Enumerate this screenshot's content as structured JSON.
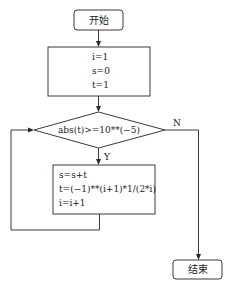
{
  "flowchart": {
    "start": {
      "label": "开始"
    },
    "init": {
      "lines": [
        "i=1",
        "s=0",
        "t=1"
      ]
    },
    "condition": {
      "label": "abs(t)>=10**(−5)"
    },
    "branch_yes": "Y",
    "branch_no": "N",
    "body": {
      "lines": [
        "s=s+t",
        "t=(−1)**(i+1)*1/(2*i)",
        "i=i+1"
      ]
    },
    "end": {
      "label": "结束"
    }
  },
  "colors": {
    "stroke": "#3a3a3a",
    "text": "#222222",
    "background": "#ffffff"
  }
}
